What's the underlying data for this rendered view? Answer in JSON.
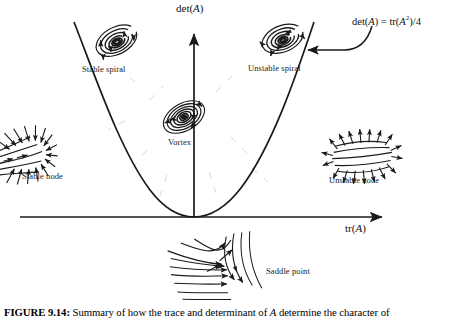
{
  "figure": {
    "caption_label": "FIGURE 9.14:",
    "caption_text_1": "Summary of how the trace and determinant of ",
    "caption_italic": "A",
    "caption_text_2": " determine the character of"
  },
  "axes": {
    "y_label_pre": "det(",
    "y_label_italic": "A",
    "y_label_post": ")",
    "x_label_pre": "tr(",
    "x_label_italic": "A",
    "x_label_post": ")",
    "origin_x": 194,
    "origin_y": 217,
    "x_axis_start": 20,
    "x_axis_end": 388,
    "y_axis_top": 30
  },
  "curve": {
    "formula_lhs_pre": "det(",
    "formula_lhs_italic": "A",
    "formula_lhs_post": ") = tr(",
    "formula_rhs_italic": "A",
    "formula_rhs_sup": "2",
    "formula_rhs_post": ")",
    "formula_divisor": "/4",
    "description": "parabola det(A) = tr(A)^2/4 separating spiral and node regions"
  },
  "regions": [
    {
      "id": "stable-spiral",
      "label": "Stable spiral",
      "label_x": 82,
      "label_y": 70,
      "phase_cx": 117,
      "phase_cy": 42
    },
    {
      "id": "unstable-spiral",
      "label": "Unstable spiral",
      "label_x": 248,
      "label_y": 69,
      "phase_cx": 283,
      "phase_cy": 40
    },
    {
      "id": "vortex",
      "label": "Vortex",
      "label_x": 168,
      "label_y": 143,
      "phase_cx": 184,
      "phase_cy": 117
    },
    {
      "id": "stable-node",
      "label": "Stable node",
      "label_x": 22,
      "label_y": 177,
      "phase_cx": 36,
      "phase_cy": 152
    },
    {
      "id": "unstable-node",
      "label": "Unstable node",
      "label_x": 329,
      "label_y": 181,
      "phase_cx": 362,
      "phase_cy": 155
    },
    {
      "id": "saddle-point",
      "label": "Saddle point",
      "label_x": 266,
      "label_y": 272,
      "phase_cx": 215,
      "phase_cy": 264
    }
  ],
  "colors": {
    "ink": "#1a1a1a",
    "background": "#ffffff",
    "dashed_guide": "#b9b9b9"
  }
}
